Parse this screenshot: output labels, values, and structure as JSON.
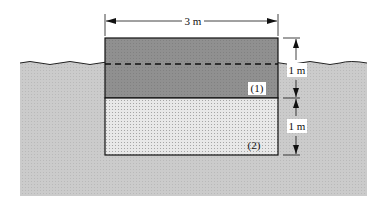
{
  "diagram": {
    "width_label": "3 m",
    "upper_height_label": "1 m",
    "lower_height_label": "1 m",
    "layer_1_label": "(1)",
    "layer_2_label": "(2)"
  },
  "colors": {
    "water": "#c9c9c9",
    "layer_1": "#8e8e8e",
    "layer_2": "#e6e6e6",
    "line": "#111111",
    "background": "#ffffff"
  }
}
